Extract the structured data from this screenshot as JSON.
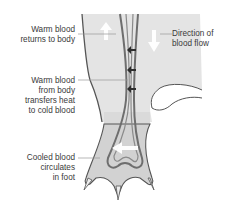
{
  "diagram": {
    "labels": {
      "warm_return": [
        "Warm blood",
        "returns to body"
      ],
      "warm_transfer": [
        "Warm blood",
        "from body",
        "transfers heat",
        "to cold blood"
      ],
      "cooled": [
        "Cooled blood",
        "circulates",
        "in foot"
      ],
      "direction": [
        "Direction of",
        "blood flow"
      ]
    },
    "colors": {
      "leg_fill": "#e4e4e4",
      "foot_fill": "#d2d2d2",
      "outline": "#555555",
      "vessel": "#6e6e6e",
      "arrow": "#ffffff",
      "heat_arrow": "#2e2e2e",
      "label_text": "#3a3a3a",
      "leader_line": "#9a9a9a"
    }
  }
}
